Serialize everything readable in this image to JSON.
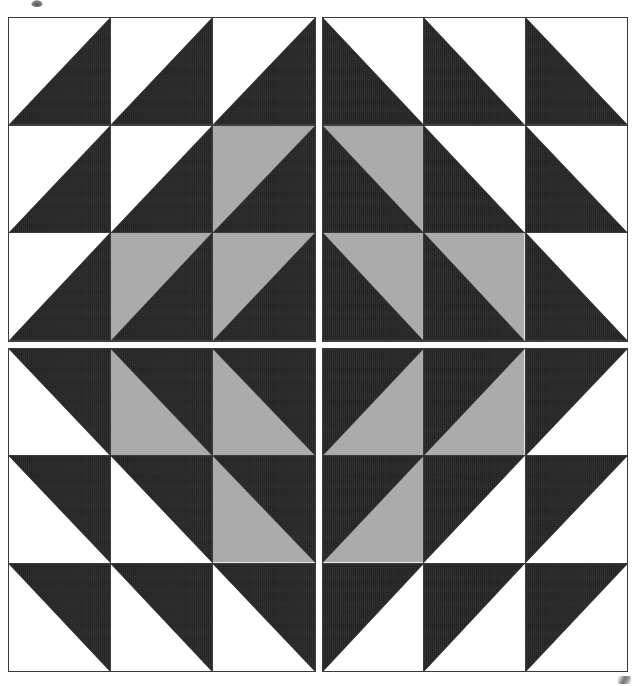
{
  "image": {
    "title": "Four-quadrant half-square-triangle quilt block",
    "width": 639,
    "height": 686,
    "background": "#ffffff"
  },
  "palette": {
    "dark": "#2b2b2b",
    "light": "#ffffff",
    "grey": "#ababab",
    "seam": "#3b3b3b",
    "paper": "#ffffff"
  },
  "layout": {
    "quadrant_rows": 2,
    "quadrant_cols": 2,
    "cells_per_quadrant_row": 3,
    "cells_per_quadrant_col": 3,
    "sashing_px": 6,
    "block_left": 8,
    "block_top": 17,
    "block_width": 620,
    "block_height": 655
  },
  "quadrants": [
    {
      "name": "top-left",
      "diagonal": "bl-tr",
      "dark_corner": "bottom-right",
      "rows": [
        [
          {
            "light": "light",
            "dark": "dark"
          },
          {
            "light": "light",
            "dark": "dark"
          },
          {
            "light": "light",
            "dark": "dark"
          }
        ],
        [
          {
            "light": "light",
            "dark": "dark"
          },
          {
            "light": "light",
            "dark": "dark"
          },
          {
            "light": "grey",
            "dark": "dark"
          }
        ],
        [
          {
            "light": "light",
            "dark": "dark"
          },
          {
            "light": "grey",
            "dark": "dark"
          },
          {
            "light": "grey",
            "dark": "dark"
          }
        ]
      ]
    },
    {
      "name": "top-right",
      "diagonal": "tl-br",
      "dark_corner": "bottom-left",
      "rows": [
        [
          {
            "light": "light",
            "dark": "dark"
          },
          {
            "light": "light",
            "dark": "dark"
          },
          {
            "light": "light",
            "dark": "dark"
          }
        ],
        [
          {
            "light": "grey",
            "dark": "dark"
          },
          {
            "light": "light",
            "dark": "dark"
          },
          {
            "light": "light",
            "dark": "dark"
          }
        ],
        [
          {
            "light": "grey",
            "dark": "dark"
          },
          {
            "light": "grey",
            "dark": "dark"
          },
          {
            "light": "light",
            "dark": "dark"
          }
        ]
      ]
    },
    {
      "name": "bottom-left",
      "diagonal": "tl-br",
      "dark_corner": "top-right",
      "rows": [
        [
          {
            "light": "light",
            "dark": "dark"
          },
          {
            "light": "grey",
            "dark": "dark"
          },
          {
            "light": "grey",
            "dark": "dark"
          }
        ],
        [
          {
            "light": "light",
            "dark": "dark"
          },
          {
            "light": "light",
            "dark": "dark"
          },
          {
            "light": "grey",
            "dark": "dark"
          }
        ],
        [
          {
            "light": "light",
            "dark": "dark"
          },
          {
            "light": "light",
            "dark": "dark"
          },
          {
            "light": "light",
            "dark": "dark"
          }
        ]
      ]
    },
    {
      "name": "bottom-right",
      "diagonal": "bl-tr",
      "dark_corner": "top-left",
      "rows": [
        [
          {
            "light": "grey",
            "dark": "dark"
          },
          {
            "light": "grey",
            "dark": "dark"
          },
          {
            "light": "light",
            "dark": "dark"
          }
        ],
        [
          {
            "light": "grey",
            "dark": "dark"
          },
          {
            "light": "light",
            "dark": "dark"
          },
          {
            "light": "light",
            "dark": "dark"
          }
        ],
        [
          {
            "light": "light",
            "dark": "dark"
          },
          {
            "light": "light",
            "dark": "dark"
          },
          {
            "light": "light",
            "dark": "dark"
          }
        ]
      ]
    }
  ],
  "artifacts": [
    {
      "name": "scan-smudge-top",
      "x": 31,
      "y": 0
    },
    {
      "name": "scan-smudge-bottom-right",
      "x": 618,
      "y": 676
    }
  ]
}
